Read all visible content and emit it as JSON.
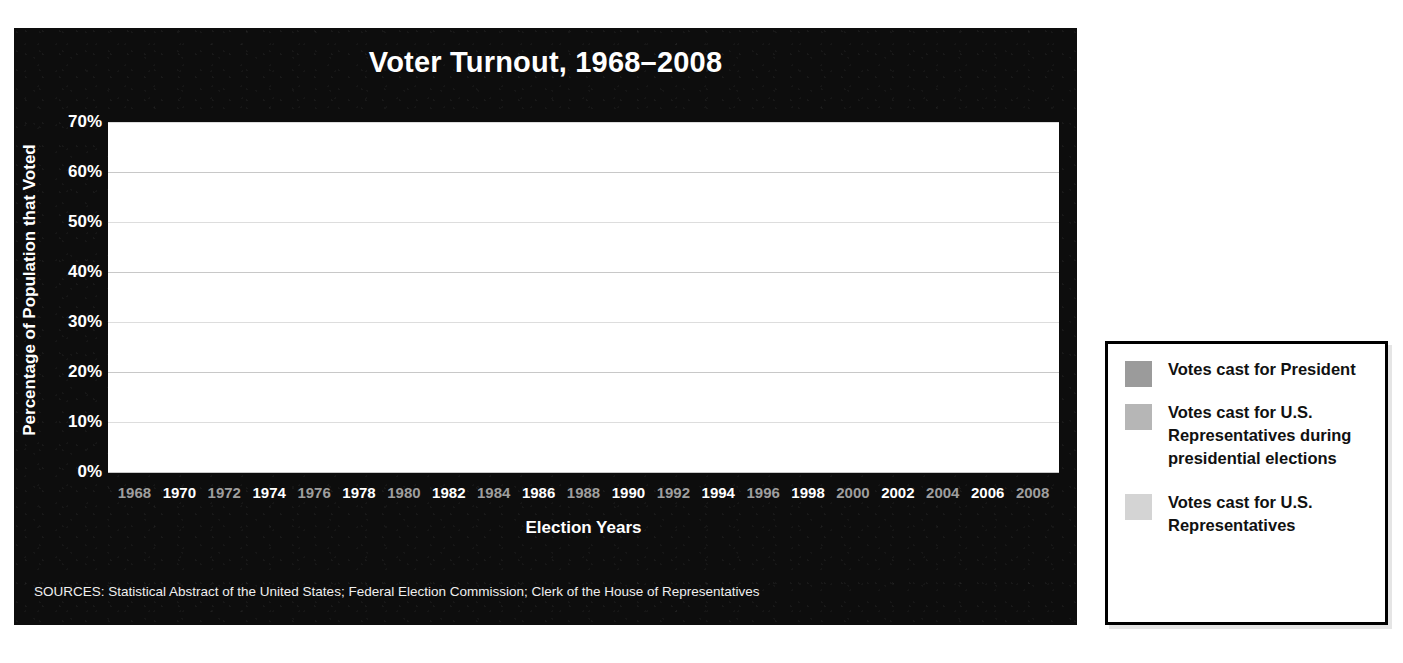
{
  "chart": {
    "title": "Voter Turnout, 1968–2008",
    "y_axis_title": "Percentage of Population that Voted",
    "x_axis_title": "Election Years",
    "sources": "SOURCES: Statistical Abstract of the United States; Federal Election Commission; Clerk of the House of Representatives",
    "y_ticks": [
      "70%",
      "60%",
      "50%",
      "40%",
      "30%",
      "20%",
      "10%",
      "0%"
    ]
  },
  "legend": {
    "items": [
      {
        "label": "Votes cast for President",
        "color": "#9b9b9b",
        "swatch_name": "legend-swatch-president"
      },
      {
        "label": "Votes cast for U.S. Representatives during presidential elections",
        "color": "#b6b6b6",
        "swatch_name": "legend-swatch-house-presidential"
      },
      {
        "label": "Votes cast for U.S. Representatives",
        "color": "#d4d4d4",
        "swatch_name": "legend-swatch-house"
      }
    ]
  },
  "colors": {
    "panel_background": "#0d0d0d",
    "plot_background": "#ffffff",
    "president": "#9b9b9b",
    "house_during_presidential": "#b6b6b6",
    "house": "#d4d4d4",
    "gridline": "#c8c8c8",
    "label_presidential_year": "#9e9e9e",
    "label_midterm_year": "#ffffff"
  },
  "chart_data": {
    "type": "bar",
    "subtype": "stacked",
    "title": "Voter Turnout, 1968–2008",
    "xlabel": "Election Years",
    "ylabel": "Percentage of Population that Voted",
    "ylim": [
      0,
      70
    ],
    "ytick_values": [
      0,
      10,
      20,
      30,
      40,
      50,
      60,
      70
    ],
    "grid": true,
    "legend_position": "right-outside",
    "categories": [
      "1968",
      "1970",
      "1972",
      "1974",
      "1976",
      "1978",
      "1980",
      "1982",
      "1984",
      "1986",
      "1988",
      "1990",
      "1992",
      "1994",
      "1996",
      "1998",
      "2000",
      "2002",
      "2004",
      "2006",
      "2008"
    ],
    "series": [
      {
        "name": "Votes cast for U.S. Representatives",
        "color": "#d4d4d4",
        "values": [
          null,
          43.8,
          null,
          34.9,
          null,
          34.5,
          null,
          37.7,
          null,
          34.3,
          null,
          33.8,
          null,
          35.8,
          null,
          33.6,
          null,
          35.3,
          null,
          35.4,
          null
        ]
      },
      {
        "name": "Votes cast for U.S. Representatives during presidential elections",
        "color": "#b6b6b6",
        "values": [
          54.5,
          null,
          49.9,
          null,
          48.0,
          null,
          46.8,
          null,
          47.0,
          null,
          44.8,
          null,
          50.2,
          null,
          45.9,
          null,
          47.5,
          null,
          51.0,
          null,
          52.0
        ]
      },
      {
        "name": "Votes cast for President",
        "color": "#9b9b9b",
        "values": [
          6.2,
          null,
          4.7,
          null,
          4.8,
          null,
          5.2,
          null,
          5.3,
          null,
          5.7,
          null,
          3.9,
          null,
          3.4,
          null,
          3.4,
          null,
          4.0,
          null,
          9.6
        ]
      }
    ],
    "bar_totals": [
      60.7,
      43.8,
      54.6,
      34.9,
      52.8,
      34.5,
      52.0,
      37.7,
      52.3,
      34.3,
      50.5,
      33.8,
      54.1,
      35.8,
      49.3,
      33.6,
      50.9,
      35.3,
      55.0,
      35.4,
      61.6
    ]
  },
  "bars": [
    {
      "year": "1968",
      "type": "presidential",
      "house": 54.5,
      "president_cap": 6.2,
      "total": 60.7
    },
    {
      "year": "1970",
      "type": "midterm",
      "house": 43.8,
      "president_cap": 0,
      "total": 43.8
    },
    {
      "year": "1972",
      "type": "presidential",
      "house": 49.9,
      "president_cap": 4.7,
      "total": 54.6
    },
    {
      "year": "1974",
      "type": "midterm",
      "house": 34.9,
      "president_cap": 0,
      "total": 34.9
    },
    {
      "year": "1976",
      "type": "presidential",
      "house": 48.0,
      "president_cap": 4.8,
      "total": 52.8
    },
    {
      "year": "1978",
      "type": "midterm",
      "house": 34.5,
      "president_cap": 0,
      "total": 34.5
    },
    {
      "year": "1980",
      "type": "presidential",
      "house": 46.8,
      "president_cap": 5.2,
      "total": 52.0
    },
    {
      "year": "1982",
      "type": "midterm",
      "house": 37.7,
      "president_cap": 0,
      "total": 37.7
    },
    {
      "year": "1984",
      "type": "presidential",
      "house": 47.0,
      "president_cap": 5.3,
      "total": 52.3
    },
    {
      "year": "1986",
      "type": "midterm",
      "house": 34.3,
      "president_cap": 0,
      "total": 34.3
    },
    {
      "year": "1988",
      "type": "presidential",
      "house": 44.8,
      "president_cap": 5.7,
      "total": 50.5
    },
    {
      "year": "1990",
      "type": "midterm",
      "house": 33.8,
      "president_cap": 0,
      "total": 33.8
    },
    {
      "year": "1992",
      "type": "presidential",
      "house": 50.2,
      "president_cap": 3.9,
      "total": 54.1
    },
    {
      "year": "1994",
      "type": "midterm",
      "house": 35.8,
      "president_cap": 0,
      "total": 35.8
    },
    {
      "year": "1996",
      "type": "presidential",
      "house": 45.9,
      "president_cap": 3.4,
      "total": 49.3
    },
    {
      "year": "1998",
      "type": "midterm",
      "house": 33.6,
      "president_cap": 0,
      "total": 33.6
    },
    {
      "year": "2000",
      "type": "presidential",
      "house": 47.5,
      "president_cap": 3.4,
      "total": 50.9
    },
    {
      "year": "2002",
      "type": "midterm",
      "house": 35.3,
      "president_cap": 0,
      "total": 35.3
    },
    {
      "year": "2004",
      "type": "presidential",
      "house": 51.0,
      "president_cap": 4.0,
      "total": 55.0
    },
    {
      "year": "2006",
      "type": "midterm",
      "house": 35.4,
      "president_cap": 0,
      "total": 35.4
    },
    {
      "year": "2008",
      "type": "presidential",
      "house": 52.0,
      "president_cap": 9.6,
      "total": 61.6
    }
  ]
}
